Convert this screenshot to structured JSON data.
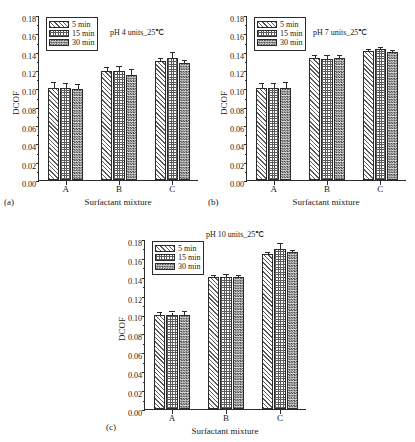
{
  "figure": {
    "caption_labels": [
      "(a)",
      "(b)",
      "(c)"
    ]
  },
  "axis": {
    "ylabel": "DCOF",
    "xlabel": "Surfactant mixture",
    "ytick_labels": [
      "0.00",
      "0.02",
      "0.04",
      "0.06",
      "0.08",
      "0.10",
      "0.12",
      "0.14",
      "0.16",
      "0.18"
    ],
    "xtick_labels": [
      "A",
      "B",
      "C"
    ]
  },
  "legend": {
    "entries": [
      {
        "label": "5 min",
        "pattern": "diagonal-hatch"
      },
      {
        "label": "15 min",
        "pattern": "cross-hatch-grid"
      },
      {
        "label": "30 min",
        "pattern": "checkerboard-dense"
      }
    ]
  },
  "panels": {
    "a": {
      "tag": "(a)",
      "condition": "pH 4 units_25℃"
    },
    "b": {
      "tag": "(b)",
      "condition": "pH 7 units_25℃"
    },
    "c": {
      "tag": "(c)",
      "condition": "pH 10 units_25℃"
    }
  },
  "chart_data": [
    {
      "type": "bar",
      "panel": "(a)",
      "title": "pH 4 units_25℃",
      "xlabel": "Surfactant mixture",
      "ylabel": "DCOF",
      "ylim": [
        0.0,
        0.18
      ],
      "ytick_step": 0.02,
      "grid": false,
      "legend_position": "upper-left",
      "categories": [
        "A",
        "B",
        "C"
      ],
      "series": [
        {
          "name": "5 min",
          "values": [
            0.1,
            0.119,
            0.13
          ],
          "errors": [
            0.0055,
            0.0035,
            0.0018
          ]
        },
        {
          "name": "15 min",
          "values": [
            0.1,
            0.119,
            0.133
          ],
          "errors": [
            0.005,
            0.0045,
            0.006
          ]
        },
        {
          "name": "30 min",
          "values": [
            0.099,
            0.115,
            0.128
          ],
          "errors": [
            0.0045,
            0.0055,
            0.0015
          ]
        }
      ]
    },
    {
      "type": "bar",
      "panel": "(b)",
      "title": "pH 7 units_25℃",
      "xlabel": "Surfactant mixture",
      "ylabel": "DCOF",
      "ylim": [
        0.0,
        0.18
      ],
      "ytick_step": 0.02,
      "grid": false,
      "legend_position": "upper-left",
      "categories": [
        "A",
        "B",
        "C"
      ],
      "series": [
        {
          "name": "5 min",
          "values": [
            0.1,
            0.133,
            0.141
          ],
          "errors": [
            0.005,
            0.0025,
            0.0012
          ]
        },
        {
          "name": "15 min",
          "values": [
            0.1,
            0.132,
            0.143
          ],
          "errors": [
            0.0045,
            0.003,
            0.001
          ]
        },
        {
          "name": "30 min",
          "values": [
            0.1,
            0.133,
            0.14
          ],
          "errors": [
            0.006,
            0.0025,
            0.0012
          ]
        }
      ]
    },
    {
      "type": "bar",
      "panel": "(c)",
      "title": "pH 10 units_25℃",
      "xlabel": "Surfactant mixture",
      "ylabel": "DCOF",
      "ylim": [
        0.0,
        0.18
      ],
      "ytick_step": 0.02,
      "grid": false,
      "legend_position": "upper-left",
      "categories": [
        "A",
        "B",
        "C"
      ],
      "series": [
        {
          "name": "5 min",
          "values": [
            0.1,
            0.14,
            0.164
          ],
          "errors": [
            0.002,
            0.0005,
            0.0012
          ]
        },
        {
          "name": "15 min",
          "values": [
            0.1,
            0.14,
            0.169
          ],
          "errors": [
            0.0022,
            0.0022,
            0.0055
          ]
        },
        {
          "name": "30 min",
          "values": [
            0.1,
            0.14,
            0.166
          ],
          "errors": [
            0.003,
            0.0005,
            0.0015
          ]
        }
      ]
    }
  ]
}
